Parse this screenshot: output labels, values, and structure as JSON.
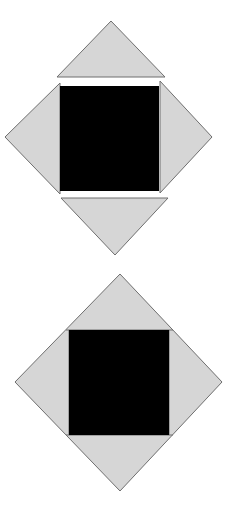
{
  "diagram": {
    "colors": {
      "background": "#ffffff",
      "triangle_fill": "#d6d6d6",
      "triangle_stroke": "#6f6f6f",
      "square_fill": "#000000"
    },
    "figures": [
      {
        "name": "exploded-figure",
        "square": {
          "x": 60,
          "y": 86,
          "w": 99,
          "h": 105
        },
        "triangles": [
          {
            "name": "top",
            "points": "111,21 57,77 165,77"
          },
          {
            "name": "left",
            "points": "5,137 60,83 60,194"
          },
          {
            "name": "right",
            "points": "212,137 160,81 160,193"
          },
          {
            "name": "bottom",
            "points": "115,255 61,198 168,198"
          }
        ]
      },
      {
        "name": "assembled-figure",
        "diamond": {
          "points": "120,274 222,382 120,491 15,382"
        },
        "square": {
          "x": 69,
          "y": 330,
          "w": 100,
          "h": 105
        },
        "inner_lines": [
          "66,330 173,330",
          "66,435 173,435",
          "69,330 69,435",
          "169,330 169,435"
        ]
      }
    ]
  }
}
